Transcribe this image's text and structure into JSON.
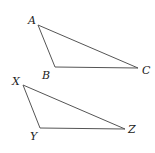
{
  "diagram": {
    "triangles": [
      {
        "name": "ABC",
        "color": "#555555",
        "vertices": [
          {
            "label": "A",
            "x": 38,
            "y": 25,
            "lx": 28,
            "ly": 24
          },
          {
            "label": "B",
            "x": 55,
            "y": 67,
            "lx": 42,
            "ly": 79
          },
          {
            "label": "C",
            "x": 138,
            "y": 68,
            "lx": 142,
            "ly": 74
          }
        ]
      },
      {
        "name": "XYZ",
        "color": "#555555",
        "vertices": [
          {
            "label": "X",
            "x": 23,
            "y": 85,
            "lx": 12,
            "ly": 85
          },
          {
            "label": "Y",
            "x": 40,
            "y": 128,
            "lx": 30,
            "ly": 140
          },
          {
            "label": "Z",
            "x": 125,
            "y": 129,
            "lx": 128,
            "ly": 133
          }
        ]
      }
    ]
  }
}
